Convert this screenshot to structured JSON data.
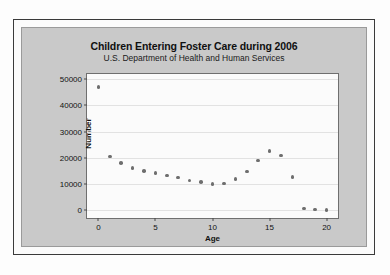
{
  "figure": {
    "background_color": "#fdfdfd",
    "panel_color": "#c9c9c9",
    "plot_background_color": "#fbfbfb",
    "frame_color": "#3a3a3a",
    "marker_color": "#6e6e6e",
    "gridline_color": "#e2e2e2"
  },
  "chart_data": {
    "type": "scatter",
    "title": "Children Entering Foster Care during 2006",
    "subtitle": "U.S. Department of Health and Human Services",
    "xlabel": "Age",
    "ylabel": "Number",
    "xlim": [
      -1,
      21
    ],
    "ylim": [
      -3000,
      52000
    ],
    "xticks": [
      0,
      5,
      10,
      15,
      20
    ],
    "yticks": [
      0,
      10000,
      20000,
      30000,
      40000,
      50000
    ],
    "xtick_labels": [
      "0",
      "5",
      "10",
      "15",
      "20"
    ],
    "ytick_labels": [
      "0",
      "10000",
      "20000",
      "30000",
      "40000",
      "50000"
    ],
    "grid": true,
    "grid_axis": "y",
    "legend": false,
    "marker": "filled-circle",
    "x": [
      0,
      1,
      2,
      3,
      4,
      5,
      6,
      7,
      8,
      9,
      10,
      11,
      12,
      13,
      14,
      15,
      16,
      17,
      18,
      19,
      20
    ],
    "y": [
      47000,
      20500,
      18000,
      16200,
      14900,
      14200,
      13200,
      12400,
      11400,
      10700,
      10000,
      10200,
      11900,
      14800,
      19000,
      22500,
      20800,
      12600,
      700,
      200,
      150
    ]
  }
}
